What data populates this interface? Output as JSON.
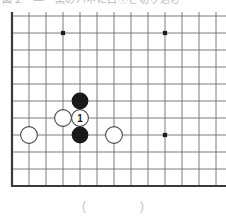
{
  "header": {
    "text": "図２　—　黒のハネに白①と切り込む"
  },
  "caption": {
    "text": "(　　)"
  },
  "board": {
    "label": "go-board-diagram",
    "cols": 13,
    "rows": 10,
    "origin_x": 12,
    "origin_y": 4,
    "spacing": 17,
    "line_color": "#6e6e6e",
    "line_width": 0.9,
    "edge_color": "#3a3a3a",
    "edge_width": 2.2,
    "background": "#ffffff",
    "star_point_color": "#1c1c1c",
    "star_point_radius": 2.1,
    "star_points": [
      {
        "name": "star-point-top-left",
        "col": 3,
        "row": 1
      },
      {
        "name": "star-point-top-right",
        "col": 9,
        "row": 1
      },
      {
        "name": "star-point-center-left",
        "col": 1,
        "row": 7
      },
      {
        "name": "star-point-center-right",
        "col": 9,
        "row": 7
      }
    ],
    "stone_radius": 8.4,
    "black_fill": "#1a1a1a",
    "white_fill": "#ffffff",
    "white_stroke": "#4a4a4a",
    "white_stroke_width": 1.1,
    "move_number_color": "#1a1a1a",
    "move_number_size": 10,
    "stones": [
      {
        "name": "black-stone-upper",
        "color": "black",
        "col": 4,
        "row": 5,
        "label": ""
      },
      {
        "name": "white-stone-left",
        "color": "white",
        "col": 3,
        "row": 6,
        "label": ""
      },
      {
        "name": "white-stone-move-1",
        "color": "white",
        "col": 4,
        "row": 6,
        "label": "1"
      },
      {
        "name": "black-stone-lower",
        "color": "black",
        "col": 4,
        "row": 7,
        "label": ""
      },
      {
        "name": "white-stone-far-left",
        "color": "white",
        "col": 1,
        "row": 7,
        "label": ""
      },
      {
        "name": "white-stone-right",
        "color": "white",
        "col": 6,
        "row": 7,
        "label": ""
      }
    ]
  }
}
